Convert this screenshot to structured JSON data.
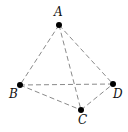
{
  "diagram": {
    "title": "",
    "type": "tetrahedron",
    "vertices": [
      {
        "id": "A",
        "label": "A",
        "x": 59,
        "y": 25,
        "label_x": 54,
        "label_y": 16
      },
      {
        "id": "B",
        "label": "B",
        "x": 20,
        "y": 85,
        "label_x": 9,
        "label_y": 98
      },
      {
        "id": "C",
        "label": "C",
        "x": 81,
        "y": 110,
        "label_x": 78,
        "label_y": 124
      },
      {
        "id": "D",
        "label": "D",
        "x": 113,
        "y": 84,
        "label_x": 113,
        "label_y": 98
      }
    ],
    "edges": [
      {
        "from": "A",
        "to": "B",
        "style": "dashed"
      },
      {
        "from": "A",
        "to": "C",
        "style": "dashed"
      },
      {
        "from": "A",
        "to": "D",
        "style": "dashed"
      },
      {
        "from": "B",
        "to": "C",
        "style": "dashed"
      },
      {
        "from": "B",
        "to": "D",
        "style": "dashed"
      },
      {
        "from": "C",
        "to": "D",
        "style": "dashed"
      }
    ],
    "colors": {
      "edge": "#8a8a8a",
      "vertex": "#000000",
      "label": "#111111",
      "background": "#ffffff"
    }
  }
}
